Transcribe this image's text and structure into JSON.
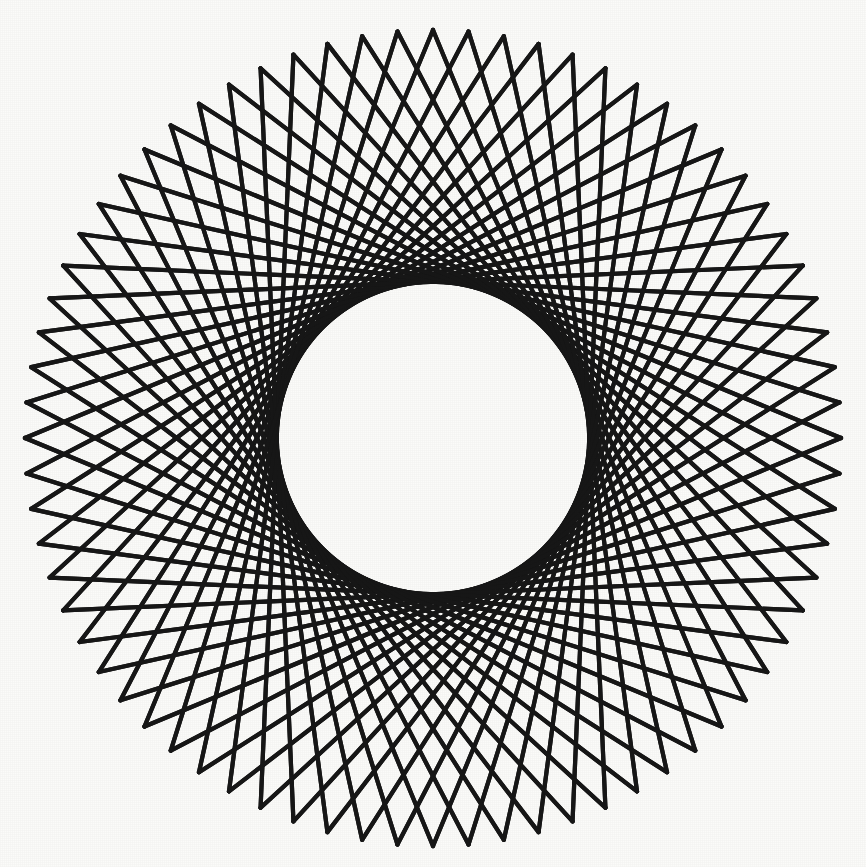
{
  "artwork": {
    "title": "Radial Chord String-Art Mandala",
    "type": "geometric-line-figure",
    "medium": "scanned line drawing",
    "caption": ""
  },
  "canvas": {
    "width": 866,
    "height": 867,
    "background_color": "#fbfbf9"
  },
  "colors": {
    "line": "#171717",
    "background": "#fbfbf9",
    "inner_field": "#fafaf7"
  },
  "geometry": {
    "center_x": 433,
    "center_y": 438,
    "outer_radius": 408,
    "point_count": 72,
    "chord_step": 27,
    "envelope_radius": 156,
    "start_angle_deg": -90,
    "line_width": 4.2,
    "spoke_count": 72,
    "spoke_inner_radius": 0,
    "spoke_outer_radius": 156
  },
  "chart_data": {
    "type": "scatter",
    "title": "Radial Chord String-Art Mandala",
    "xlabel": "",
    "ylabel": "",
    "xlim": [
      25,
      841
    ],
    "ylim": [
      30,
      846
    ],
    "grid": false,
    "legend": "none",
    "series": [
      {
        "name": "outer-chord-vertices",
        "point_count": 72,
        "radius": 408,
        "angle_step_deg": 5
      },
      {
        "name": "chords",
        "count": 72,
        "step": 27,
        "envelope_radius": 156
      }
    ],
    "annotations": []
  }
}
